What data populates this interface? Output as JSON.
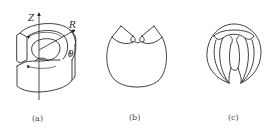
{
  "figure": {
    "panels": [
      {
        "id": "a",
        "caption": "(a)",
        "description": "Isometric view of a split annular ring (open cylinder segment) with cylindrical coordinate axes",
        "axis_labels": {
          "z": "Z",
          "r": "R",
          "theta": "θ"
        }
      },
      {
        "id": "b",
        "caption": "(b)",
        "description": "Front view of ring cross-section with V-shaped notch at top"
      },
      {
        "id": "c",
        "caption": "(c)",
        "description": "Circular outline with internal folded / constricted central channel"
      }
    ]
  }
}
